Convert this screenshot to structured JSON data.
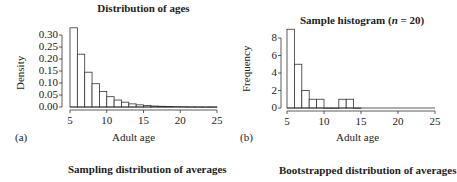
{
  "chart_data": [
    {
      "type": "bar",
      "panel_label": "(a)",
      "title": "Distribution of ages",
      "xlabel": "Adult age",
      "ylabel": "Density",
      "xlim": [
        5,
        25
      ],
      "ylim": [
        0,
        0.32
      ],
      "xticks": [
        "5",
        "10",
        "15",
        "20",
        "25"
      ],
      "yticks": [
        "0.00",
        "0.05",
        "0.10",
        "0.15",
        "0.20",
        "0.25",
        "0.30"
      ],
      "bin_edges": [
        5,
        6,
        7,
        8,
        9,
        10,
        11,
        12,
        13,
        14,
        15,
        16,
        17,
        18,
        19,
        20,
        21,
        22,
        23,
        24,
        25
      ],
      "values": [
        0.33,
        0.22,
        0.145,
        0.097,
        0.065,
        0.043,
        0.029,
        0.02,
        0.013,
        0.009,
        0.006,
        0.004,
        0.003,
        0.002,
        0.0015,
        0.001,
        0.0005,
        0.0003,
        0.0002,
        0.0001
      ],
      "grid": false
    },
    {
      "type": "bar",
      "panel_label": "(b)",
      "title": "Sample histogram (n = 20)",
      "title_parts": [
        "Sample histogram (",
        "n",
        " = 20)"
      ],
      "xlabel": "Adult age",
      "ylabel": "Frequency",
      "xlim": [
        5,
        25
      ],
      "ylim": [
        0,
        9
      ],
      "xticks": [
        "5",
        "10",
        "15",
        "20",
        "25"
      ],
      "yticks": [
        "0",
        "2",
        "4",
        "6",
        "8"
      ],
      "bin_edges": [
        5,
        6,
        7,
        8,
        9,
        10,
        11,
        12,
        13,
        14,
        15
      ],
      "values": [
        9,
        5,
        2,
        1,
        1,
        0,
        0,
        1,
        1,
        0
      ],
      "grid": false
    }
  ],
  "lower_titles": {
    "left": "Sampling distribution of averages",
    "right": "Bootstrapped distribution of averages"
  }
}
